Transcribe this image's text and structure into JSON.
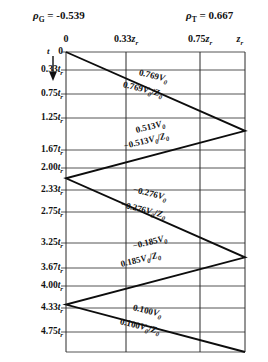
{
  "header": {
    "gamma_source": {
      "symbol": "ρ",
      "subscript": "G",
      "eq": "=",
      "value": "-0.539"
    },
    "gamma_load": {
      "symbol": "ρ",
      "subscript": "T",
      "eq": "=",
      "value": "0.667"
    }
  },
  "axes": {
    "time_axis_label": "t",
    "time_axis_icon": "down-arrow-icon",
    "distance_ticks": [
      {
        "label": "0",
        "unit": "",
        "sub": "",
        "x": 66
      },
      {
        "label": "0.33",
        "unit": "z",
        "sub": "r",
        "x": 126
      },
      {
        "label": "0.75",
        "unit": "z",
        "sub": "r",
        "x": 200
      },
      {
        "label": "",
        "unit": "z",
        "sub": "r",
        "x": 240
      }
    ],
    "time_ticks": [
      {
        "label": "0",
        "unit": "",
        "sub": "",
        "y": 52
      },
      {
        "label": "0.33",
        "unit": "t",
        "sub": "r",
        "y": 70
      },
      {
        "label": "0.75",
        "unit": "t",
        "sub": "r",
        "y": 94
      },
      {
        "label": "1.25",
        "unit": "t",
        "sub": "r",
        "y": 118
      },
      {
        "label": "1.67",
        "unit": "t",
        "sub": "r",
        "y": 150
      },
      {
        "label": "2.00",
        "unit": "t",
        "sub": "r",
        "y": 168
      },
      {
        "label": "2.33",
        "unit": "t",
        "sub": "r",
        "y": 190
      },
      {
        "label": "2.75",
        "unit": "t",
        "sub": "r",
        "y": 212
      },
      {
        "label": "3.25",
        "unit": "t",
        "sub": "r",
        "y": 243
      },
      {
        "label": "3.67",
        "unit": "t",
        "sub": "r",
        "y": 268
      },
      {
        "label": "4.00",
        "unit": "t",
        "sub": "r",
        "y": 286
      },
      {
        "label": "4.33",
        "unit": "t",
        "sub": "r",
        "y": 308
      },
      {
        "label": "4.75",
        "unit": "t",
        "sub": "r",
        "y": 332
      }
    ]
  },
  "chart_data": {
    "type": "line",
    "title": "",
    "xlabel": "",
    "ylabel": "t",
    "grid": true,
    "legend": "none",
    "xlim": [
      0,
      1
    ],
    "ylim": [
      0,
      4.75
    ],
    "x_tick_values": [
      0,
      0.33,
      0.75,
      1.0
    ],
    "x_tick_labels": [
      "0",
      "0.33 z_r",
      "0.75 z_r",
      "z_r"
    ],
    "y_tick_values": [
      0,
      0.33,
      0.75,
      1.25,
      1.67,
      2.0,
      2.33,
      2.75,
      3.25,
      3.67,
      4.0,
      4.33,
      4.75
    ],
    "y_tick_labels": [
      "0",
      "0.33 t_r",
      "0.75 t_r",
      "1.25 t_r",
      "1.67 t_r",
      "2.00 t_r",
      "2.33 t_r",
      "2.75 t_r",
      "3.25 t_r",
      "3.67 t_r",
      "4.00 t_r",
      "4.33 t_r",
      "4.75 t_r"
    ],
    "bounce_vertices": [
      {
        "x": 0.0,
        "t": 0.0
      },
      {
        "x": 1.0,
        "t": 1.25
      },
      {
        "x": 0.0,
        "t": 2.0
      },
      {
        "x": 1.0,
        "t": 3.25
      },
      {
        "x": 0.0,
        "t": 4.0
      },
      {
        "x": 1.0,
        "t": 4.75
      }
    ],
    "series": [
      {
        "name": "voltage-wave-1",
        "value": "0.769",
        "sign": "+",
        "quantity": "V0",
        "label": "0.769V₀"
      },
      {
        "name": "current-wave-1",
        "value": "0.769",
        "sign": "+",
        "quantity": "V0/Z0",
        "label": "0.769V₀/Z₀"
      },
      {
        "name": "voltage-wave-2",
        "value": "0.513",
        "sign": "+",
        "quantity": "V0",
        "label": "0.513V₀"
      },
      {
        "name": "current-wave-2",
        "value": "-0.513",
        "sign": "-",
        "quantity": "V0/Z0",
        "label": "−0.513V₀/Z₀"
      },
      {
        "name": "voltage-wave-3",
        "value": "-0.276",
        "sign": "-",
        "quantity": "V0",
        "label": "−0.276V₀"
      },
      {
        "name": "current-wave-3",
        "value": "-0.276",
        "sign": "-",
        "quantity": "V0/Z0",
        "label": "−0.276V₀/Z₀"
      },
      {
        "name": "voltage-wave-4",
        "value": "-0.185",
        "sign": "-",
        "quantity": "V0",
        "label": "−0.185V₀"
      },
      {
        "name": "current-wave-4",
        "value": "0.185",
        "sign": "+",
        "quantity": "V0/Z0",
        "label": "0.185V₀/Z₀"
      },
      {
        "name": "voltage-wave-5",
        "value": "0.100",
        "sign": "+",
        "quantity": "V0",
        "label": "0.100V₀"
      },
      {
        "name": "current-wave-5",
        "value": "0.100",
        "sign": "+",
        "quantity": "V0/Z0",
        "label": "0.100V₀/Z₀"
      }
    ]
  },
  "annotations": [
    {
      "name": "annotation-0769-v",
      "num": "0.769",
      "neg": false,
      "den": false,
      "x": 139,
      "y": 73,
      "rot": 14
    },
    {
      "name": "annotation-0769-i",
      "num": "0.769",
      "neg": false,
      "den": true,
      "x": 123,
      "y": 85,
      "rot": 14
    },
    {
      "name": "annotation-0513-v",
      "num": "0.513",
      "neg": false,
      "den": false,
      "x": 136,
      "y": 131,
      "rot": -14
    },
    {
      "name": "annotation-0513-i",
      "num": "0.513",
      "neg": true,
      "den": true,
      "x": 124,
      "y": 147,
      "rot": -14
    },
    {
      "name": "annotation-0276-v",
      "num": "0.276",
      "neg": true,
      "den": false,
      "x": 133,
      "y": 190,
      "rot": 14
    },
    {
      "name": "annotation-0276-i",
      "num": "0.276",
      "neg": true,
      "den": true,
      "x": 121,
      "y": 205,
      "rot": 14
    },
    {
      "name": "annotation-0185-v",
      "num": "0.185",
      "neg": true,
      "den": false,
      "x": 133,
      "y": 247,
      "rot": -14
    },
    {
      "name": "annotation-0185-i",
      "num": "0.185",
      "neg": false,
      "den": true,
      "x": 121,
      "y": 265,
      "rot": -14
    },
    {
      "name": "annotation-0100-v",
      "num": "0.100",
      "neg": false,
      "den": false,
      "x": 133,
      "y": 308,
      "rot": 14
    },
    {
      "name": "annotation-0100-i",
      "num": "0.100",
      "neg": false,
      "den": true,
      "x": 120,
      "y": 322,
      "rot": 14
    }
  ]
}
